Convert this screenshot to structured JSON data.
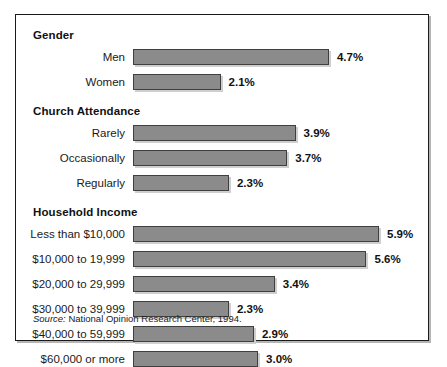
{
  "figure": {
    "source_prefix": "Source:",
    "source_text": " National Opinion Research Center, 1994.",
    "bar_color": "#8b8b8b",
    "bar_border_color": "#3f3f3f",
    "frame_border_color": "#1a1a1a",
    "value_suffix": "%"
  },
  "chart_data": {
    "type": "bar",
    "orientation": "horizontal",
    "title": "",
    "subtitle": "",
    "xlabel": "",
    "ylabel": "",
    "xlim": [
      0,
      5.9
    ],
    "grid": false,
    "legend": "none",
    "source": "Source: National Opinion Research Center, 1994.",
    "groups": [
      {
        "name": "Gender",
        "categories": [
          "Men",
          "Women"
        ],
        "values": [
          4.7,
          2.1
        ],
        "value_labels": [
          "4.7%",
          "2.1%"
        ]
      },
      {
        "name": "Church Attendance",
        "categories": [
          "Rarely",
          "Occasionally",
          "Regularly"
        ],
        "values": [
          3.9,
          3.7,
          2.3
        ],
        "value_labels": [
          "3.9%",
          "3.7%",
          "2.3%"
        ]
      },
      {
        "name": "Household Income",
        "categories": [
          "Less than $10,000",
          "$10,000 to 19,999",
          "$20,000 to 29,999",
          "$30,000 to 39,999",
          "$40,000 to 59,999",
          "$60,000 or more"
        ],
        "values": [
          5.9,
          5.6,
          3.4,
          2.3,
          2.9,
          3.0
        ],
        "value_labels": [
          "5.9%",
          "5.6%",
          "3.4%",
          "2.3%",
          "2.9%",
          "3.0%"
        ]
      }
    ]
  }
}
